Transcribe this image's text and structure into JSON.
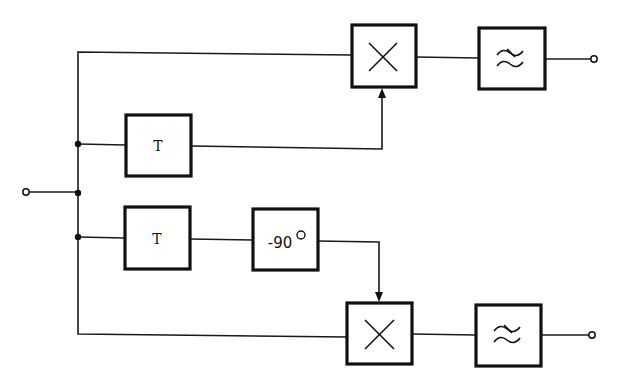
{
  "diagram": {
    "type": "block-diagram",
    "input_terminal": {
      "label": ""
    },
    "blocks": [
      {
        "id": "delay_top",
        "label": "T",
        "kind": "delay"
      },
      {
        "id": "mixer_top",
        "label": "×",
        "kind": "multiplier"
      },
      {
        "id": "lpf_top",
        "label": "≈",
        "kind": "low-pass-filter"
      },
      {
        "id": "delay_bottom",
        "label": "T",
        "kind": "delay"
      },
      {
        "id": "phase_shift",
        "label": "-90",
        "degree_symbol": "o",
        "kind": "phase-shifter"
      },
      {
        "id": "mixer_bottom",
        "label": "×",
        "kind": "multiplier"
      },
      {
        "id": "lpf_bottom",
        "label": "≈",
        "kind": "low-pass-filter"
      }
    ],
    "connections": [
      {
        "from": "input",
        "to": "mixer_top",
        "note": "direct path"
      },
      {
        "from": "input",
        "to": "delay_top"
      },
      {
        "from": "delay_top",
        "to": "mixer_top",
        "note": "arrow into bottom of mixer"
      },
      {
        "from": "mixer_top",
        "to": "lpf_top"
      },
      {
        "from": "lpf_top",
        "to": "output_top"
      },
      {
        "from": "input",
        "to": "delay_bottom"
      },
      {
        "from": "delay_bottom",
        "to": "phase_shift"
      },
      {
        "from": "phase_shift",
        "to": "mixer_bottom",
        "note": "arrow into top of mixer"
      },
      {
        "from": "input",
        "to": "mixer_bottom",
        "note": "direct path"
      },
      {
        "from": "mixer_bottom",
        "to": "lpf_bottom"
      },
      {
        "from": "lpf_bottom",
        "to": "output_bottom"
      }
    ],
    "outputs": [
      {
        "id": "output_top",
        "label": ""
      },
      {
        "id": "output_bottom",
        "label": ""
      }
    ]
  }
}
